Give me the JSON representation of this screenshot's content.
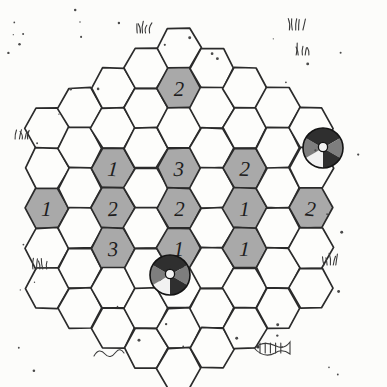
{
  "board": {
    "title": "Hexagonal Game Board",
    "description": "Hand-drawn hexagonal tile board with numbered gray tiles and two beach-ball pieces",
    "style": "hand-drawn sketch",
    "hex_orientation": "flat-top",
    "columns": 9,
    "colors": {
      "tile_empty": "#fdfdfb",
      "tile_filled": "#a9a9a9",
      "ink": "#2b2b2b",
      "label": "#1d1d1d",
      "background": "#fcfcfa",
      "ball_dark": "#2f2f2f",
      "ball_mid": "#7e7e7e",
      "ball_light": "#f2f2f2"
    },
    "geometry": {
      "hex_width": 44,
      "hex_height": 40,
      "col_step": 33,
      "row_step": 40,
      "origin_x": 47,
      "origin_y": 48
    },
    "columns_data": [
      {
        "index": 0,
        "count": 5,
        "offset": 2.0
      },
      {
        "index": 1,
        "count": 6,
        "offset": 1.5
      },
      {
        "index": 2,
        "count": 7,
        "offset": 1.0
      },
      {
        "index": 3,
        "count": 8,
        "offset": 0.5
      },
      {
        "index": 4,
        "count": 9,
        "offset": 0.0
      },
      {
        "index": 5,
        "count": 8,
        "offset": 0.5
      },
      {
        "index": 6,
        "count": 7,
        "offset": 1.0
      },
      {
        "index": 7,
        "count": 6,
        "offset": 1.5
      },
      {
        "index": 8,
        "count": 5,
        "offset": 2.0
      }
    ],
    "numbered_tiles": [
      {
        "id": "tile-c4-r1",
        "col": 4,
        "row": 1,
        "value": "2"
      },
      {
        "id": "tile-c2-r2",
        "col": 2,
        "row": 2,
        "value": "1"
      },
      {
        "id": "tile-c6-r2",
        "col": 6,
        "row": 2,
        "value": "2"
      },
      {
        "id": "tile-c4-r3",
        "col": 4,
        "row": 3,
        "value": "3"
      },
      {
        "id": "tile-c0-r2",
        "col": 0,
        "row": 2,
        "value": "1"
      },
      {
        "id": "tile-c2-r3",
        "col": 2,
        "row": 3,
        "value": "2"
      },
      {
        "id": "tile-c6-r3",
        "col": 6,
        "row": 3,
        "value": "1"
      },
      {
        "id": "tile-c8-r2",
        "col": 8,
        "row": 2,
        "value": "2"
      },
      {
        "id": "tile-c4-r4",
        "col": 4,
        "row": 4,
        "value": "2"
      },
      {
        "id": "tile-c2-r4",
        "col": 2,
        "row": 4,
        "value": "3"
      },
      {
        "id": "tile-c6-r4",
        "col": 6,
        "row": 4,
        "value": "1"
      },
      {
        "id": "tile-c4-r5",
        "col": 4,
        "row": 5,
        "value": "1"
      }
    ],
    "pieces": [
      {
        "id": "ball-right",
        "name": "beach-ball-piece-right",
        "x": 323,
        "y": 148,
        "r": 20
      },
      {
        "id": "ball-center",
        "name": "beach-ball-piece-center",
        "x": 170,
        "y": 275,
        "r": 20
      }
    ],
    "decorations": {
      "grass_tufts": [
        {
          "x": 143,
          "y": 28
        },
        {
          "x": 296,
          "y": 25
        },
        {
          "x": 302,
          "y": 50
        },
        {
          "x": 22,
          "y": 134
        },
        {
          "x": 40,
          "y": 264
        },
        {
          "x": 330,
          "y": 260
        }
      ],
      "fish_skeleton": {
        "x": 272,
        "y": 348
      },
      "squiggle": {
        "x": 108,
        "y": 352
      },
      "speck_count": 64
    }
  }
}
